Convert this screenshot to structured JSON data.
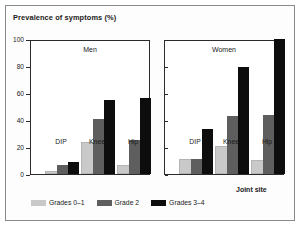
{
  "chart_data": {
    "type": "bar",
    "title": "Prevalence of symptoms (%)",
    "xlabel": "Joint site",
    "ylabel": "Prevalence of symptoms (%)",
    "ylim": [
      0,
      100
    ],
    "yticks": [
      0,
      20,
      40,
      60,
      80,
      100
    ],
    "grid": false,
    "legend_position": "bottom-left",
    "categories": [
      "DIP",
      "Knee",
      "Hip"
    ],
    "panels": [
      {
        "name": "Men",
        "series": [
          {
            "name": "Grades 0–1",
            "color": "#c9c9c9",
            "values": [
              1,
              22,
              5
            ]
          },
          {
            "name": "Grade 2",
            "color": "#5e5e5e",
            "values": [
              7,
              41,
              25
            ]
          },
          {
            "name": "Grades 3–4",
            "color": "#0d0d0d",
            "values": [
              9,
              55,
              56
            ]
          }
        ]
      },
      {
        "name": "Women",
        "series": [
          {
            "name": "Grades 0–1",
            "color": "#c9c9c9",
            "values": [
              10,
              19,
              9
            ]
          },
          {
            "name": "Grade 2",
            "color": "#5e5e5e",
            "values": [
              11,
              43,
              44
            ]
          },
          {
            "name": "Grades 3–4",
            "color": "#0d0d0d",
            "values": [
              33,
              79,
              100
            ]
          }
        ]
      }
    ],
    "legend": [
      {
        "label": "Grades 0–1",
        "color": "#c9c9c9"
      },
      {
        "label": "Grade 2",
        "color": "#5e5e5e"
      },
      {
        "label": "Grades 3–4",
        "color": "#0d0d0d"
      }
    ]
  }
}
